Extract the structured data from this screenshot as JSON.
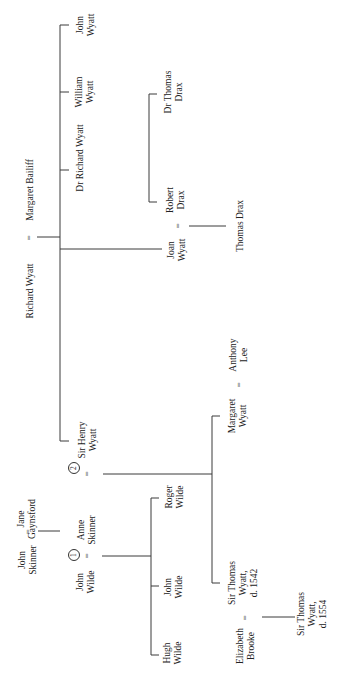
{
  "diagram": {
    "type": "family-tree",
    "orientation": "rotated-90-ccw",
    "people": {
      "richard_wyatt": "Richard Wyatt",
      "margaret_bailiff": "Margaret Bailiff",
      "john_wyatt": "John\nWyatt",
      "william_wyatt": "William\nWyatt",
      "dr_richard_wyatt": "Dr Richard Wyatt",
      "joan_wyatt": "Joan\nWyatt",
      "robert_drax": "Robert\nDrax",
      "dr_thomas_drax": "Dr Thomas\nDrax",
      "thomas_drax": "Thomas Drax",
      "sir_henry_wyatt": "Sir Henry\nWyatt",
      "anne_skinner": "Anne\nSkinner",
      "john_skinner": "John\nSkinner",
      "jane_gaynsford": "Jane\nGaynsford",
      "john_wilde_sr": "John\nWilde",
      "margaret_wyatt": "Margaret\nWyatt",
      "anthony_lee": "Anthony\nLee",
      "roger_wilde": "Roger\nWilde",
      "john_wilde_jr": "John\nWilde",
      "hugh_wilde": "Hugh\nWilde",
      "sir_thomas_wyatt_1542": "Sir Thomas\nWyatt,\nd. 1542",
      "elizabeth_brooke": "Elizabeth\nBrooke",
      "sir_thomas_wyatt_1554": "Sir Thomas\nWyatt,\nd. 1554"
    },
    "symbols": {
      "marriage": "=",
      "first_marriage": "1",
      "second_marriage": "2"
    },
    "colors": {
      "line": "#3a3a3a",
      "text": "#222222",
      "background": "#ffffff"
    },
    "relationships": [
      {
        "type": "marriage",
        "a": "Richard Wyatt",
        "b": "Margaret Bailiff"
      },
      {
        "type": "marriage",
        "a": "Joan Wyatt",
        "b": "Robert Drax"
      },
      {
        "type": "marriage",
        "a": "John Skinner",
        "b": "Jane Gaynsford"
      },
      {
        "type": "marriage",
        "a": "John Wilde",
        "b": "Anne Skinner",
        "order": "1"
      },
      {
        "type": "marriage",
        "a": "Anne Skinner",
        "b": "Sir Henry Wyatt",
        "order": "2"
      },
      {
        "type": "marriage",
        "a": "Margaret Wyatt",
        "b": "Anthony Lee"
      },
      {
        "type": "marriage",
        "a": "Elizabeth Brooke",
        "b": "Sir Thomas Wyatt, d. 1542"
      }
    ]
  }
}
